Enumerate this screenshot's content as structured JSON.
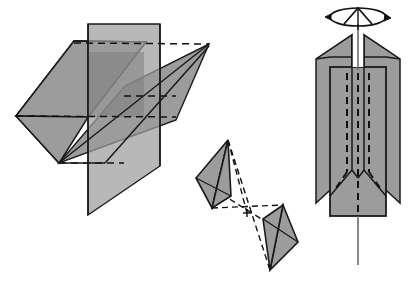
{
  "figure": {
    "background_color": "#ffffff",
    "stroke_color": "#000000",
    "fill_gray": "#9c9c9c",
    "fill_gray_dark": "#7e7e7e",
    "axis_line_color": "#6b6b6b",
    "panels": [
      {
        "name": "intersecting-planes",
        "label": "",
        "description": "Three intersecting parallelogram planes with dashed hidden edges"
      },
      {
        "name": "bowtie-triangles",
        "label": "",
        "description": "Two shaded triangles opposed through an inversion centre marked by crossing dashed lines"
      },
      {
        "name": "rotation-axis-cylinder",
        "label": "",
        "description": "Vertical column with four vertical mirror planes, a vertical rotation axis and a curved rotation arrow at the top"
      }
    ]
  },
  "geometry": {
    "plane_a_points": "17,117 75,41 145,41 88,117 88,215 17,193",
    "plane_left_square": "17,117 75,41 145,41 88,117 57,163 17,117",
    "left_square": "16,116 74,41 146,42 88,117 57,163",
    "left_square_quad": "16,116 74,41 146,42 88,117",
    "left_square_full": "16,116 74,41 146,42 88,117 60,162",
    "vertical_plane": "88,24 160,24 160,166 88,215",
    "vertical_plane_quad": "88,24 160,24 160,166 88,215",
    "thin_plane": "57,163 123,87 209,44 168,129",
    "center_dot": "247,213",
    "tri_upper": "228,140 196,178 212,208",
    "tri_upper_extra": "196,178 212,208 231,196",
    "tri_lower": "283,205 298,242 270,270",
    "tri_lower_extra": "283,205 263,219 270,270",
    "cyl_axis_top_y": 18,
    "cyl_axis_bottom_y": 265,
    "cyl_axis_x": 358
  },
  "annotations": {
    "rotation_arrow_name": "rotation-arrow",
    "inversion_center_name": "inversion-centre",
    "axis_name": "rotation-axis"
  }
}
